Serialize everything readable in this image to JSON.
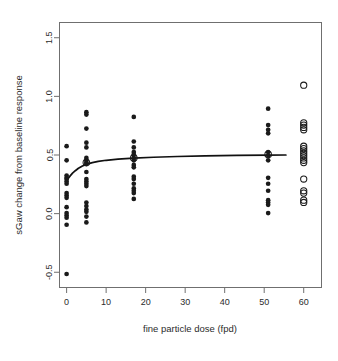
{
  "chart_data": {
    "type": "scatter",
    "title": "",
    "xlabel": "fine particle dose (fpd)",
    "ylabel": "sGaw change from baseline response",
    "xlim": [
      -1.8,
      64.5
    ],
    "ylim": [
      -0.63,
      1.63
    ],
    "xticks": [
      0,
      10,
      20,
      30,
      40,
      50,
      60
    ],
    "xtick_labels": [
      "0",
      "10",
      "20",
      "30",
      "40",
      "50",
      "60"
    ],
    "yticks": [
      -0.5,
      0.0,
      0.5,
      1.0,
      1.5
    ],
    "ytick_labels": [
      "-0.5",
      "0.0",
      "0.5",
      "1.0",
      "1.5"
    ],
    "grid": false,
    "legend": "none",
    "box": true,
    "series": [
      {
        "name": "individual responses (filled)",
        "marker": "filled-circle",
        "color": "#1a1a1a",
        "points": [
          {
            "x": 0,
            "y": 0.575
          },
          {
            "x": 0,
            "y": 0.455
          },
          {
            "x": 0,
            "y": 0.325
          },
          {
            "x": 0,
            "y": 0.305
          },
          {
            "x": 0,
            "y": 0.295
          },
          {
            "x": 0,
            "y": 0.275
          },
          {
            "x": 0,
            "y": 0.255
          },
          {
            "x": 0,
            "y": 0.175
          },
          {
            "x": 0,
            "y": 0.155
          },
          {
            "x": 0,
            "y": 0.135
          },
          {
            "x": 0,
            "y": 0.055
          },
          {
            "x": 0,
            "y": 0.005
          },
          {
            "x": 0,
            "y": -0.015
          },
          {
            "x": 0,
            "y": -0.035
          },
          {
            "x": 0,
            "y": -0.095
          },
          {
            "x": 0,
            "y": -0.515
          },
          {
            "x": 5,
            "y": 0.865
          },
          {
            "x": 5,
            "y": 0.845
          },
          {
            "x": 5,
            "y": 0.725
          },
          {
            "x": 5,
            "y": 0.605
          },
          {
            "x": 5,
            "y": 0.565
          },
          {
            "x": 5,
            "y": 0.475
          },
          {
            "x": 5,
            "y": 0.455
          },
          {
            "x": 5,
            "y": 0.435
          },
          {
            "x": 5,
            "y": 0.425
          },
          {
            "x": 5,
            "y": 0.355
          },
          {
            "x": 5,
            "y": 0.295
          },
          {
            "x": 5,
            "y": 0.275
          },
          {
            "x": 5,
            "y": 0.255
          },
          {
            "x": 5,
            "y": 0.235
          },
          {
            "x": 5,
            "y": 0.095
          },
          {
            "x": 5,
            "y": 0.065
          },
          {
            "x": 5,
            "y": 0.035
          },
          {
            "x": 5,
            "y": 0.015
          },
          {
            "x": 5,
            "y": -0.025
          },
          {
            "x": 5,
            "y": -0.075
          },
          {
            "x": 17,
            "y": 0.825
          },
          {
            "x": 17,
            "y": 0.615
          },
          {
            "x": 17,
            "y": 0.565
          },
          {
            "x": 17,
            "y": 0.525
          },
          {
            "x": 17,
            "y": 0.505
          },
          {
            "x": 17,
            "y": 0.475
          },
          {
            "x": 17,
            "y": 0.455
          },
          {
            "x": 17,
            "y": 0.415
          },
          {
            "x": 17,
            "y": 0.395
          },
          {
            "x": 17,
            "y": 0.315
          },
          {
            "x": 17,
            "y": 0.295
          },
          {
            "x": 17,
            "y": 0.255
          },
          {
            "x": 17,
            "y": 0.215
          },
          {
            "x": 17,
            "y": 0.195
          },
          {
            "x": 17,
            "y": 0.175
          },
          {
            "x": 17,
            "y": 0.125
          },
          {
            "x": 51,
            "y": 0.895
          },
          {
            "x": 51,
            "y": 0.755
          },
          {
            "x": 51,
            "y": 0.715
          },
          {
            "x": 51,
            "y": 0.685
          },
          {
            "x": 51,
            "y": 0.525
          },
          {
            "x": 51,
            "y": 0.495
          },
          {
            "x": 51,
            "y": 0.455
          },
          {
            "x": 51,
            "y": 0.305
          },
          {
            "x": 51,
            "y": 0.255
          },
          {
            "x": 51,
            "y": 0.195
          },
          {
            "x": 51,
            "y": 0.115
          },
          {
            "x": 51,
            "y": 0.095
          },
          {
            "x": 51,
            "y": 0.075
          },
          {
            "x": 51,
            "y": 0.005
          }
        ]
      },
      {
        "name": "predicted responses (open)",
        "marker": "open-circle",
        "color": "#1a1a1a",
        "points": [
          {
            "x": 60,
            "y": 1.095
          },
          {
            "x": 60,
            "y": 0.775
          },
          {
            "x": 60,
            "y": 0.755
          },
          {
            "x": 60,
            "y": 0.735
          },
          {
            "x": 60,
            "y": 0.715
          },
          {
            "x": 60,
            "y": 0.575
          },
          {
            "x": 60,
            "y": 0.555
          },
          {
            "x": 60,
            "y": 0.535
          },
          {
            "x": 60,
            "y": 0.515
          },
          {
            "x": 60,
            "y": 0.495
          },
          {
            "x": 60,
            "y": 0.475
          },
          {
            "x": 60,
            "y": 0.455
          },
          {
            "x": 60,
            "y": 0.435
          },
          {
            "x": 60,
            "y": 0.295
          },
          {
            "x": 60,
            "y": 0.195
          },
          {
            "x": 60,
            "y": 0.175
          },
          {
            "x": 60,
            "y": 0.115
          },
          {
            "x": 60,
            "y": 0.095
          }
        ]
      },
      {
        "name": "group means (open)",
        "marker": "open-circle",
        "color": "#1a1a1a",
        "points": [
          {
            "x": 5,
            "y": 0.435
          },
          {
            "x": 17,
            "y": 0.475
          },
          {
            "x": 51,
            "y": 0.505
          }
        ]
      }
    ],
    "fit_curve": {
      "name": "fitted dose-response curve",
      "color": "#111111",
      "points": [
        {
          "x": 0.0,
          "y": 0.275
        },
        {
          "x": 0.4,
          "y": 0.3
        },
        {
          "x": 0.9,
          "y": 0.322
        },
        {
          "x": 1.5,
          "y": 0.345
        },
        {
          "x": 2.2,
          "y": 0.366
        },
        {
          "x": 3.0,
          "y": 0.387
        },
        {
          "x": 4.0,
          "y": 0.406
        },
        {
          "x": 5.0,
          "y": 0.42
        },
        {
          "x": 6.5,
          "y": 0.435
        },
        {
          "x": 8.0,
          "y": 0.445
        },
        {
          "x": 10.0,
          "y": 0.455
        },
        {
          "x": 13.0,
          "y": 0.465
        },
        {
          "x": 17.0,
          "y": 0.474
        },
        {
          "x": 22.0,
          "y": 0.481
        },
        {
          "x": 28.0,
          "y": 0.487
        },
        {
          "x": 35.0,
          "y": 0.492
        },
        {
          "x": 43.0,
          "y": 0.496
        },
        {
          "x": 51.0,
          "y": 0.499
        },
        {
          "x": 55.5,
          "y": 0.5
        }
      ]
    }
  }
}
